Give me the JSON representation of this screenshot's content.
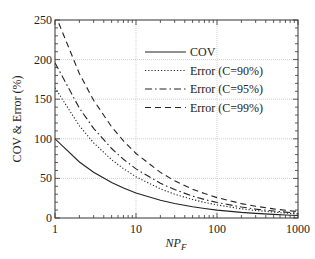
{
  "chart_data": {
    "type": "line",
    "title": "",
    "xlabel": "NP_F",
    "ylabel": "COV & Error (%)",
    "xscale": "log",
    "xlim": [
      1,
      1200
    ],
    "ylim": [
      0,
      250
    ],
    "x_ticks": [
      1,
      10,
      100,
      1000
    ],
    "x_tick_labels": [
      "1",
      "10",
      "100",
      "1000"
    ],
    "y_ticks": [
      0,
      50,
      100,
      150,
      200,
      250
    ],
    "y_tick_labels": [
      "0",
      "50",
      "100",
      "150",
      "200",
      "250"
    ],
    "grid": true,
    "legend_position": "upper right",
    "x": [
      1,
      2,
      3,
      5,
      7,
      10,
      20,
      30,
      50,
      70,
      100,
      200,
      300,
      500,
      700,
      1000,
      1200
    ],
    "series": [
      {
        "name": "COV",
        "style": "solid",
        "values": [
          100,
          70.7,
          57.7,
          44.7,
          37.8,
          31.6,
          22.4,
          18.3,
          14.1,
          12.0,
          10.0,
          7.1,
          5.8,
          4.5,
          3.8,
          3.2,
          2.9
        ]
      },
      {
        "name": "Error (C=90%)",
        "style": "dotted",
        "values": [
          164.5,
          116.3,
          95.0,
          73.6,
          62.2,
          52.0,
          36.8,
          30.0,
          23.3,
          19.7,
          16.5,
          11.6,
          9.5,
          7.4,
          6.2,
          5.2,
          4.7
        ]
      },
      {
        "name": "Error (C=95%)",
        "style": "dashdot",
        "values": [
          196.0,
          138.6,
          113.2,
          87.7,
          74.1,
          62.0,
          43.8,
          35.8,
          27.7,
          23.4,
          19.6,
          13.9,
          11.3,
          8.8,
          7.4,
          6.2,
          5.7
        ]
      },
      {
        "name": "Error (C=99%)",
        "style": "dashed",
        "values": [
          257.6,
          182.2,
          148.7,
          115.2,
          97.4,
          81.5,
          57.6,
          47.0,
          36.4,
          30.8,
          25.8,
          18.2,
          14.9,
          11.5,
          9.7,
          8.1,
          7.4
        ]
      }
    ]
  }
}
